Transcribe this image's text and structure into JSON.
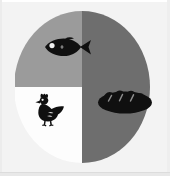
{
  "page": {
    "background_color": "#f3f3f3",
    "caption_fragment": "s:"
  },
  "figure": {
    "name": "food-group-pie-chart",
    "center_x": 82,
    "center_y": 87,
    "radius_x": 68,
    "radius_y": 76
  },
  "chart_data": {
    "type": "pie",
    "title": "",
    "subtitle": "",
    "xlabel": "",
    "ylabel": "",
    "grid": false,
    "legend": "none",
    "labels_shown": false,
    "start_angle_deg": 0,
    "direction": "clockwise",
    "categories": [
      "Bread",
      "Chicken",
      "Fish"
    ],
    "values": [
      50,
      25,
      25
    ],
    "units": "percent",
    "colors": [
      "#6e6e6e",
      "#fdfdfd",
      "#9b9b9b"
    ],
    "slices": [
      {
        "label": "Bread",
        "icon": "bread-loaf-icon",
        "value": 50,
        "percent": "50%",
        "color": "#6e6e6e",
        "start_deg": 0,
        "end_deg": 180,
        "icon_x": 127,
        "icon_y": 96
      },
      {
        "label": "Chicken",
        "icon": "chicken-hen-icon",
        "value": 25,
        "percent": "25%",
        "color": "#fdfdfd",
        "start_deg": 180,
        "end_deg": 270,
        "icon_x": 44,
        "icon_y": 107
      },
      {
        "label": "Fish",
        "icon": "fish-icon",
        "value": 25,
        "percent": "25%",
        "color": "#9b9b9b",
        "start_deg": 270,
        "end_deg": 360,
        "icon_x": 59,
        "icon_y": 47
      }
    ]
  },
  "icons": {
    "fish": "fish-icon",
    "chicken": "chicken-hen-icon",
    "bread": "bread-loaf-icon"
  }
}
